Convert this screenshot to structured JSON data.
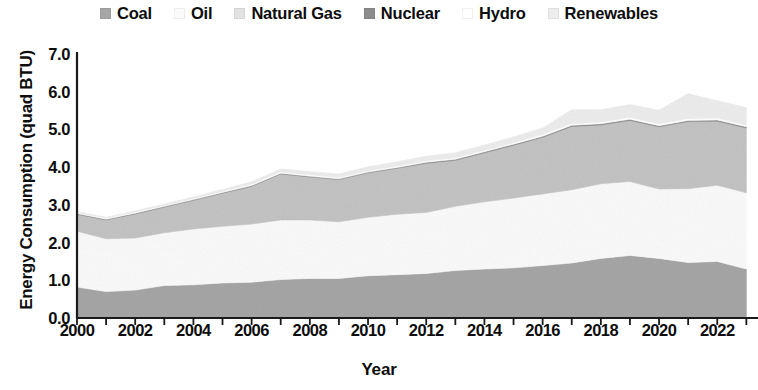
{
  "chart_data": {
    "type": "area",
    "stacked": true,
    "title": "",
    "xlabel": "Year",
    "ylabel": "Energy Consumption (quad BTU)",
    "xlim": [
      2000,
      2023.4
    ],
    "ylim": [
      0.0,
      7.0
    ],
    "ytick_labels": [
      "0.0",
      "1.0",
      "2.0",
      "3.0",
      "4.0",
      "5.0",
      "6.0",
      "7.0"
    ],
    "ytick_values": [
      0,
      1,
      2,
      3,
      4,
      5,
      6,
      7
    ],
    "xtick_labels": [
      "2000",
      "2002",
      "2004",
      "2006",
      "2008",
      "2010",
      "2012",
      "2014",
      "2016",
      "2018",
      "2020",
      "2022"
    ],
    "xtick_values": [
      2000,
      2002,
      2004,
      2006,
      2008,
      2010,
      2012,
      2014,
      2016,
      2018,
      2020,
      2022
    ],
    "minor_xticks": [
      2000,
      2001,
      2002,
      2003,
      2004,
      2005,
      2006,
      2007,
      2008,
      2009,
      2010,
      2011,
      2012,
      2013,
      2014,
      2015,
      2016,
      2017,
      2018,
      2019,
      2020,
      2021,
      2022,
      2023
    ],
    "grid": false,
    "legend_position": "top",
    "x": [
      2000,
      2001,
      2002,
      2003,
      2004,
      2005,
      2006,
      2007,
      2008,
      2009,
      2010,
      2011,
      2012,
      2013,
      2014,
      2015,
      2016,
      2017,
      2018,
      2019,
      2020,
      2021,
      2022,
      2023
    ],
    "series": [
      {
        "name": "Coal",
        "color": "#a6a6a6",
        "values": [
          0.82,
          0.7,
          0.74,
          0.86,
          0.88,
          0.93,
          0.95,
          1.02,
          1.05,
          1.05,
          1.12,
          1.15,
          1.18,
          1.26,
          1.3,
          1.33,
          1.39,
          1.46,
          1.58,
          1.66,
          1.58,
          1.47,
          1.5,
          1.3
        ]
      },
      {
        "name": "Oil",
        "color": "#fbfbfb",
        "values": [
          1.48,
          1.4,
          1.38,
          1.4,
          1.48,
          1.5,
          1.54,
          1.58,
          1.55,
          1.5,
          1.55,
          1.6,
          1.62,
          1.7,
          1.78,
          1.85,
          1.9,
          1.94,
          1.98,
          1.96,
          1.84,
          1.96,
          2.02,
          2.02
        ]
      },
      {
        "name": "Natural Gas",
        "color": "#c4c4c4",
        "values": [
          0.45,
          0.5,
          0.64,
          0.68,
          0.76,
          0.88,
          1.0,
          1.22,
          1.14,
          1.12,
          1.18,
          1.22,
          1.3,
          1.22,
          1.3,
          1.4,
          1.5,
          1.68,
          1.56,
          1.62,
          1.65,
          1.78,
          1.7,
          1.72
        ]
      },
      {
        "name": "Nuclear",
        "color": "#8c8c8c",
        "values": [
          0.02,
          0.02,
          0.02,
          0.02,
          0.02,
          0.02,
          0.02,
          0.02,
          0.02,
          0.02,
          0.02,
          0.02,
          0.03,
          0.03,
          0.03,
          0.03,
          0.03,
          0.03,
          0.03,
          0.03,
          0.03,
          0.03,
          0.03,
          0.03
        ]
      },
      {
        "name": "Hydro",
        "color": "#ffffff",
        "values": [
          0.03,
          0.03,
          0.03,
          0.03,
          0.03,
          0.03,
          0.04,
          0.04,
          0.04,
          0.04,
          0.04,
          0.04,
          0.04,
          0.04,
          0.04,
          0.04,
          0.05,
          0.05,
          0.05,
          0.05,
          0.05,
          0.05,
          0.05,
          0.05
        ]
      },
      {
        "name": "Renewables",
        "color": "#ededed",
        "values": [
          0.02,
          0.02,
          0.03,
          0.03,
          0.04,
          0.05,
          0.06,
          0.07,
          0.08,
          0.09,
          0.1,
          0.11,
          0.12,
          0.13,
          0.14,
          0.15,
          0.17,
          0.36,
          0.32,
          0.34,
          0.36,
          0.66,
          0.46,
          0.46
        ]
      }
    ],
    "totals": [
      2.82,
      2.67,
      2.84,
      3.02,
      3.21,
      3.41,
      3.61,
      3.95,
      3.88,
      3.82,
      4.01,
      4.14,
      4.29,
      4.38,
      4.59,
      4.8,
      5.04,
      5.52,
      5.52,
      5.66,
      5.51,
      5.95,
      5.76,
      5.58
    ]
  },
  "legend": {
    "items": [
      {
        "label": "Coal",
        "color": "#a6a6a6"
      },
      {
        "label": "Oil",
        "color": "#fbfbfb"
      },
      {
        "label": "Natural Gas",
        "color": "#e2e2e2"
      },
      {
        "label": "Nuclear",
        "color": "#8c8c8c"
      },
      {
        "label": "Hydro",
        "color": "#ffffff"
      },
      {
        "label": "Renewables",
        "color": "#ededed"
      }
    ]
  },
  "axes": {
    "axis_color": "#1a1a1a",
    "text_color": "#0d0d0d"
  }
}
